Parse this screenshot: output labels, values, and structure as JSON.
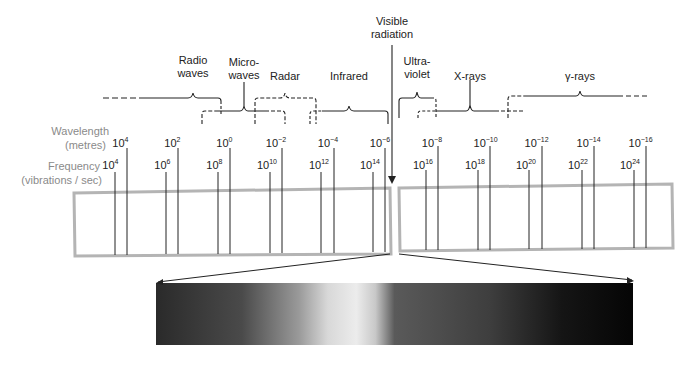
{
  "bands": [
    {
      "id": "radio",
      "lines": [
        "Radio",
        "waves"
      ],
      "x": 193
    },
    {
      "id": "microwaves",
      "lines": [
        "Micro-",
        "waves"
      ],
      "x": 243
    },
    {
      "id": "radar",
      "lines": [
        "Radar"
      ],
      "x": 285
    },
    {
      "id": "infrared",
      "lines": [
        "Infrared"
      ],
      "x": 349
    },
    {
      "id": "visible",
      "lines": [
        "Visible",
        "radiation"
      ],
      "x": 392
    },
    {
      "id": "ultraviolet",
      "lines": [
        "Ultra-",
        "violet"
      ],
      "x": 417
    },
    {
      "id": "xrays",
      "lines": [
        "X-rays"
      ],
      "x": 470
    },
    {
      "id": "gammarays",
      "lines": [
        "γ-rays"
      ],
      "x": 580
    }
  ],
  "axes": {
    "wavelength": {
      "label_line1": "Wavelength",
      "label_line2": "(metres)"
    },
    "frequency": {
      "label_line1": "Frequency",
      "label_line2": "(vibrations / sec)"
    }
  },
  "wavelength_ticks": [
    {
      "base": "10",
      "exp": "4"
    },
    {
      "base": "10",
      "exp": "2"
    },
    {
      "base": "10",
      "exp": "0"
    },
    {
      "base": "10",
      "exp": "−2"
    },
    {
      "base": "10",
      "exp": "−4"
    },
    {
      "base": "10",
      "exp": "−6"
    },
    {
      "base": "10",
      "exp": "−8"
    },
    {
      "base": "10",
      "exp": "−10"
    },
    {
      "base": "10",
      "exp": "−12"
    },
    {
      "base": "10",
      "exp": "−14"
    },
    {
      "base": "10",
      "exp": "−16"
    }
  ],
  "frequency_ticks": [
    {
      "base": "10",
      "exp": "4"
    },
    {
      "base": "10",
      "exp": "6"
    },
    {
      "base": "10",
      "exp": "8"
    },
    {
      "base": "10",
      "exp": "10"
    },
    {
      "base": "10",
      "exp": "12"
    },
    {
      "base": "10",
      "exp": "14"
    },
    {
      "base": "10",
      "exp": "16"
    },
    {
      "base": "10",
      "exp": "18"
    },
    {
      "base": "10",
      "exp": "20"
    },
    {
      "base": "10",
      "exp": "22"
    },
    {
      "base": "10",
      "exp": "24"
    }
  ],
  "colors": {
    "box_border": "#b4b4b4",
    "line": "#222222",
    "axis_label": "#8a8a8a"
  },
  "visible_spectrum_gradient": {
    "stops": [
      {
        "pos": 0,
        "color": "#2a2a2a"
      },
      {
        "pos": 18,
        "color": "#4a4a4a"
      },
      {
        "pos": 30,
        "color": "#9a9a9a"
      },
      {
        "pos": 36,
        "color": "#d8d8d8"
      },
      {
        "pos": 42,
        "color": "#ececec"
      },
      {
        "pos": 46,
        "color": "#c8c8c8"
      },
      {
        "pos": 50,
        "color": "#5a5a5a"
      },
      {
        "pos": 70,
        "color": "#3e3e3e"
      },
      {
        "pos": 85,
        "color": "#151515"
      },
      {
        "pos": 100,
        "color": "#050505"
      }
    ]
  }
}
